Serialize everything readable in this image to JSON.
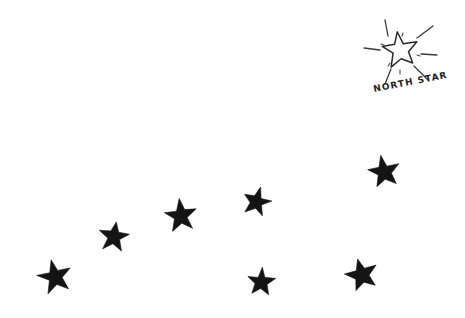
{
  "scene": {
    "title": "North Star Constellation Sketch",
    "background_color": "#ffffff",
    "width": 465,
    "height": 318,
    "medium": "hand-drawn ink sketch"
  },
  "label": {
    "north_star_text": "NORTH  STAR",
    "rotation_degrees": -11,
    "x": 374,
    "y": 92,
    "color": "#222222"
  },
  "polaris": {
    "name": "north-star",
    "style": "outline",
    "cx": 400,
    "cy": 50,
    "outer_radius": 19,
    "inner_radius": 7.6,
    "rotation_degrees": -8,
    "stroke_color": "#2b2b2b",
    "sparkle_ray_count": 8
  },
  "sparkle_rays": [
    {
      "name": "ray-up",
      "x1": 388,
      "y1": 36,
      "x2": 385,
      "y2": 20
    },
    {
      "name": "ray-upper-right",
      "x1": 417,
      "y1": 38,
      "x2": 433,
      "y2": 26
    },
    {
      "name": "ray-right",
      "x1": 421,
      "y1": 54,
      "x2": 437,
      "y2": 55
    },
    {
      "name": "ray-lower-right",
      "x1": 414,
      "y1": 66,
      "x2": 428,
      "y2": 80
    },
    {
      "name": "ray-left",
      "x1": 380,
      "y1": 50,
      "x2": 364,
      "y2": 48
    },
    {
      "name": "ray-lower-left",
      "x1": 391,
      "y1": 69,
      "x2": 385,
      "y2": 84
    }
  ],
  "sparkle_ticks": [
    {
      "name": "tick-inner-upper-left",
      "x1": 384,
      "y1": 45,
      "x2": 381,
      "y2": 44
    },
    {
      "name": "tick-inner-top",
      "x1": 402,
      "y1": 36,
      "x2": 403,
      "y2": 33
    },
    {
      "name": "tick-inner-right",
      "x1": 417,
      "y1": 55,
      "x2": 420,
      "y2": 56
    },
    {
      "name": "tick-inner-bottom",
      "x1": 400,
      "y1": 70,
      "x2": 400,
      "y2": 74
    },
    {
      "name": "tick-inner-lower-left",
      "x1": 390,
      "y1": 63,
      "x2": 388,
      "y2": 66
    }
  ],
  "constellation": {
    "name": "big-dipper",
    "star_count": 7,
    "fill_color": "#141414",
    "stars": [
      {
        "name": "star-1",
        "cx": 55,
        "cy": 277,
        "outer_radius": 18,
        "inner_radius": 7.3,
        "rotation_degrees": -14
      },
      {
        "name": "star-2",
        "cx": 114,
        "cy": 237,
        "outer_radius": 16,
        "inner_radius": 6.5,
        "rotation_degrees": 8
      },
      {
        "name": "star-3",
        "cx": 181,
        "cy": 216,
        "outer_radius": 17,
        "inner_radius": 6.9,
        "rotation_degrees": -6
      },
      {
        "name": "star-4",
        "cx": 257,
        "cy": 202,
        "outer_radius": 15,
        "inner_radius": 6.1,
        "rotation_degrees": 14
      },
      {
        "name": "star-5",
        "cx": 384,
        "cy": 172,
        "outer_radius": 17,
        "inner_radius": 6.9,
        "rotation_degrees": -10
      },
      {
        "name": "star-6",
        "cx": 261,
        "cy": 282,
        "outer_radius": 15,
        "inner_radius": 6.1,
        "rotation_degrees": 4
      },
      {
        "name": "star-7",
        "cx": 362,
        "cy": 275,
        "outer_radius": 17,
        "inner_radius": 6.9,
        "rotation_degrees": -16
      }
    ]
  }
}
